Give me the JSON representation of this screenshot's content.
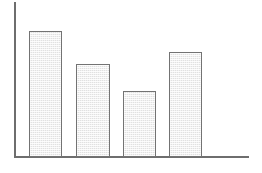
{
  "chart_data": {
    "type": "bar",
    "title": "",
    "subtitle": "",
    "xlabel": "",
    "ylabel": "",
    "categories": [
      "1",
      "2",
      "3",
      "4"
    ],
    "values": [
      81,
      60,
      43,
      68
    ],
    "ylim": [
      0,
      100
    ],
    "xlim": [
      0,
      100
    ],
    "grid": false,
    "legend": false,
    "legend_position": "none",
    "tick_labels_x": [],
    "tick_labels_y": [],
    "annotations": [],
    "series": [
      {
        "name": "series-1",
        "values": [
          81,
          60,
          43,
          68
        ]
      }
    ],
    "style": {
      "bar_fill": "#e1e1e1",
      "bar_border": "#737373",
      "axis_color": "#6e6e6e",
      "background": "#ffffff",
      "fill_pattern": "fine-checkered-dither"
    },
    "bars": [
      {
        "label": "1",
        "value": 81,
        "left_px": 29,
        "top_px": 31,
        "width_px": 33,
        "height_px": 126
      },
      {
        "label": "2",
        "value": 60,
        "left_px": 76,
        "top_px": 64,
        "width_px": 34,
        "height_px": 93
      },
      {
        "label": "3",
        "value": 43,
        "left_px": 123,
        "top_px": 91,
        "width_px": 33,
        "height_px": 66
      },
      {
        "label": "4",
        "value": 68,
        "left_px": 169,
        "top_px": 52,
        "width_px": 33,
        "height_px": 105
      }
    ]
  }
}
